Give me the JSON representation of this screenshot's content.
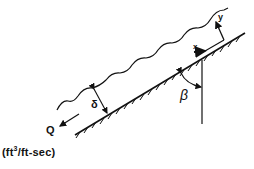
{
  "diagram": {
    "type": "inclined-film-flow-schematic",
    "labels": {
      "flow_rate": "Q",
      "film_thickness": "δ",
      "angle": "β",
      "x_axis": "x",
      "y_axis": "y"
    },
    "units": {
      "prefix": "(ft",
      "exponent": "3",
      "suffix": "/ft-sec)"
    },
    "colors": {
      "ink": "#111111",
      "background": "#ffffff"
    }
  }
}
